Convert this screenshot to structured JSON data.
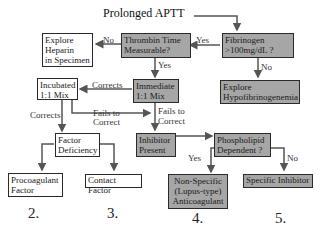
{
  "title": "Prolonged APTT",
  "nodes": {
    "fibrinogen": {
      "lines": [
        "Fibrinogen",
        ">100mg/dL ?"
      ]
    },
    "thrombin_time": {
      "lines": [
        "Thrombin Time",
        "Measurable?"
      ]
    },
    "explore_heparin": {
      "lines": [
        "Explore",
        "Heparin",
        "in Specimen"
      ]
    },
    "explore_hypofib": {
      "lines": [
        "Explore",
        "Hypofibrinogenemia"
      ]
    },
    "immediate_mix": {
      "lines": [
        "Immediate",
        "1:1 Mix"
      ]
    },
    "incubated_mix": {
      "lines": [
        "Incubated",
        "1:1 Mix"
      ]
    },
    "factor_deficiency": {
      "lines": [
        "Factor",
        "Deficiency"
      ]
    },
    "inhibitor_present": {
      "lines": [
        "Inhibitor",
        "Present"
      ]
    },
    "phospholipid_dependent": {
      "lines": [
        "Phospholipid",
        "Dependent ?"
      ]
    },
    "procoagulant_factor": {
      "lines": [
        "Procoagulant",
        "Factor"
      ]
    },
    "contact_factor": {
      "lines": [
        "Contact Factor"
      ]
    },
    "nonspecific": {
      "lines": [
        "Non-Specific",
        "(Lupus-type)",
        "Anticoagulant"
      ]
    },
    "specific_inhibitor": {
      "lines": [
        "Specific Inhibitor"
      ]
    }
  },
  "edge_labels": {
    "fib_yes": "Yes",
    "fib_no": "No",
    "tt_no": "No",
    "tt_yes": "Yes",
    "imm_corrects": "Corrects",
    "imm_fails_1": "Fails to",
    "imm_fails_2": "Correct",
    "inc_corrects": "Corrects",
    "inc_fails_1": "Fails to",
    "inc_fails_2": "Correct",
    "pl_yes": "Yes",
    "pl_no": "No"
  },
  "outcome_numbers": [
    "2.",
    "3.",
    "4.",
    "5."
  ],
  "colors": {
    "gray_box": "#a6a6a6",
    "border": "#2a2a2a",
    "arrow": "#555555"
  }
}
